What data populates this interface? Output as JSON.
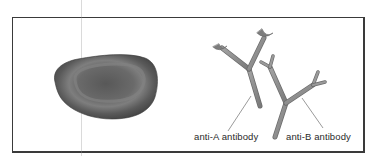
{
  "diagram": {
    "elements": [
      {
        "id": "red-blood-cell",
        "label": ""
      },
      {
        "id": "anti-a-antibody",
        "label": "anti-A antibody"
      },
      {
        "id": "anti-b-antibody",
        "label": "anti-B antibody"
      }
    ],
    "labels": {
      "anti_a": "anti-A antibody",
      "anti_b": "anti-B antibody"
    },
    "colors": {
      "frame": "#3a3a3a",
      "cell_dark": "#4a4a4a",
      "cell_mid": "#6e6e6e",
      "cell_highlight": "#8a8a8a",
      "antibody_body": "#8f8f8f",
      "antibody_edge": "#6b6b6b",
      "leader_line": "#555555"
    }
  }
}
